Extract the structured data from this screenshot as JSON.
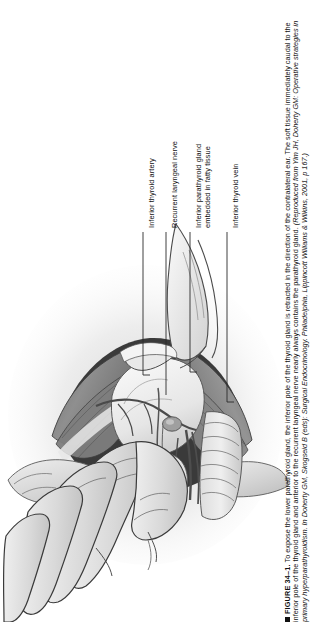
{
  "figure": {
    "marker_icon": "square-bullet-icon",
    "number_label": "FIGURE 34–1.",
    "caption_text": "To expose the lower parathyroid gland, the inferior pole of the thyroid gland is retracted in the direction of the contralateral ear. The soft tissue immediately caudal to the inferior pole of the thyroid gland and anterior to the recurrent laryngeal nerve nearly always contains the parathyroid gland. ",
    "source_open": "(Reproduced from ",
    "source_authors": "Yim JH, Doherty GM: ",
    "source_title": "Operative strategies in primary hyperparathyroidism.",
    "source_in": " In Doherty GM, Skogseid B (eds): ",
    "source_book": "Surgical Endocrinology.",
    "source_publisher": " Philadelphia, Lippincott Williams & Wilkins, 2001, p 167.)",
    "labels": [
      {
        "id": "inferior-thyroid-artery",
        "line1": "Inferior thyroid artery",
        "line2": ""
      },
      {
        "id": "recurrent-laryngeal-nerve",
        "line1": "Recurrent laryngeal nerve",
        "line2": ""
      },
      {
        "id": "inferior-parathyroid-gland",
        "line1": "Inferior parathyroid gland",
        "line2": "embedded in fatty tissue"
      },
      {
        "id": "inferior-thyroid-vein",
        "line1": "Inferior thyroid vein",
        "line2": ""
      }
    ],
    "colors": {
      "background": "#ffffff",
      "ink": "#111111",
      "leader_line": "#2b2b2b",
      "muscle_mid": "#8d8d8d",
      "muscle_dark": "#5d5d5d",
      "skin_light": "#d8d8d8",
      "gland_light": "#efefef",
      "shadow": "#b9b9b9"
    },
    "illustration_alt": "Surgical illustration of a neck dissection showing a gloved hand retracting the thyroid gland with labeled leader lines"
  }
}
